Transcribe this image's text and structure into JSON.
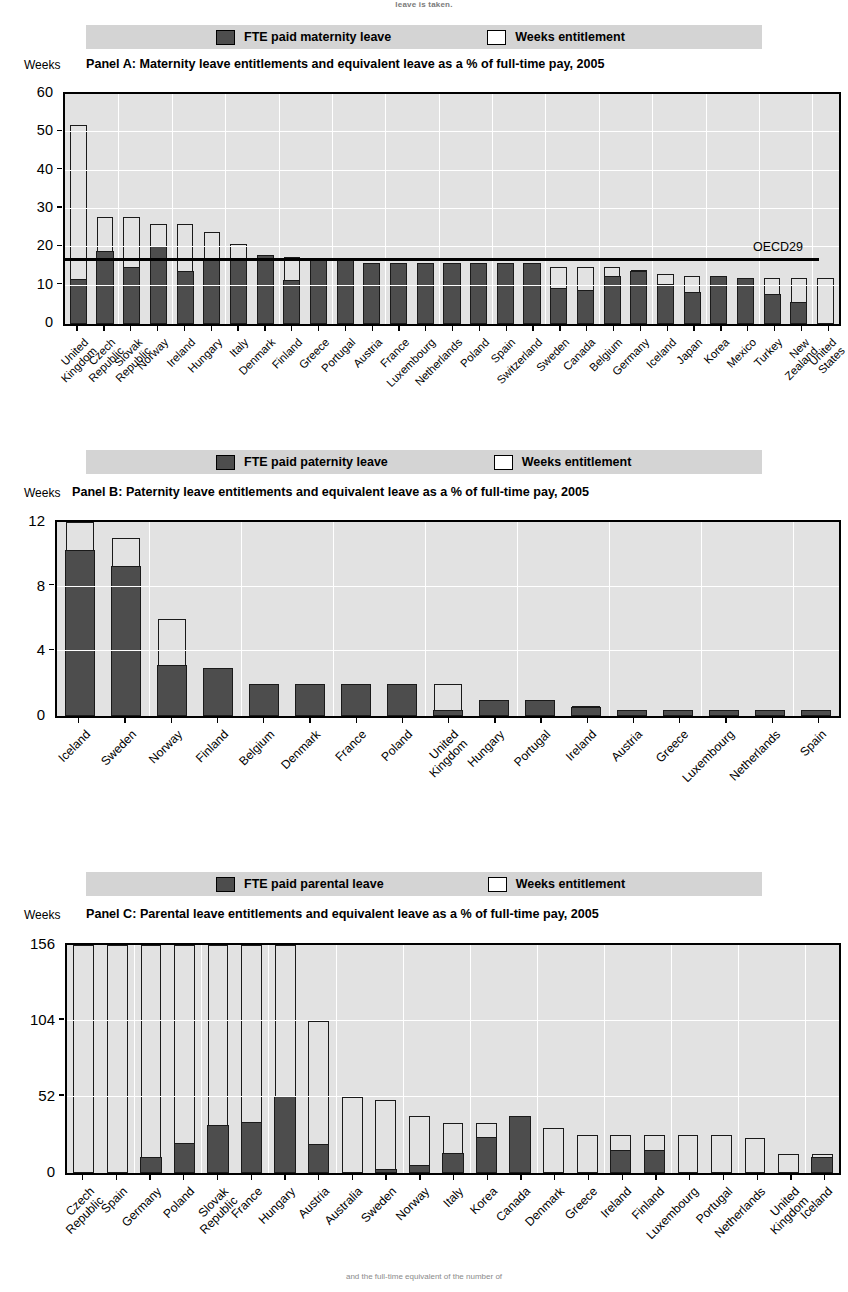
{
  "top_caption": "leave is taken.",
  "footer_caption": "and the full-time equivalent of the number of",
  "legend": {
    "entitlement_label": "Weeks entitlement",
    "panelA_fte_label": "FTE paid maternity leave",
    "panelB_fte_label": "FTE paid paternity leave",
    "panelC_fte_label": "FTE paid parental leave"
  },
  "axis_unit_label": "Weeks",
  "reference_line": {
    "label": "OECD29",
    "value": 17.4
  },
  "colors": {
    "fte": "#4d4d4d",
    "entitlement": "#ffffff",
    "plot_bg": "#e2e2e2",
    "legend_bg": "#d4d4d4",
    "grid": "#ffffff",
    "axis": "#000000"
  },
  "chart_data": [
    {
      "type": "bar",
      "panel": "Panel A",
      "title": "Panel A:  Maternity leave entitlements and equivalent leave as a % of full-time pay, 2005",
      "ylabel": "Weeks",
      "ylim": [
        0,
        60
      ],
      "yticks": [
        0,
        10,
        20,
        30,
        40,
        50,
        60
      ],
      "grid": true,
      "legend_position": "top",
      "reference_line": {
        "name": "OECD29",
        "value": 17.4
      },
      "categories": [
        "United Kingdom",
        "Czech Republic",
        "Slovak Republic",
        "Norway",
        "Ireland",
        "Hungary",
        "Italy",
        "Denmark",
        "Finland",
        "Greece",
        "Portugal",
        "Austria",
        "France",
        "Luxembourg",
        "Netherlands",
        "Poland",
        "Spain",
        "Switzerland",
        "Sweden",
        "Canada",
        "Belgium",
        "Germany",
        "Iceland",
        "Japan",
        "Korea",
        "Mexico",
        "Turkey",
        "New Zealand",
        "United States"
      ],
      "series": [
        {
          "name": "Weeks entitlement",
          "values": [
            52,
            28,
            28,
            26,
            26,
            24,
            21,
            18,
            17.5,
            17,
            17,
            16,
            16,
            16,
            16,
            16,
            16,
            16,
            15,
            15,
            15,
            14,
            13,
            12.5,
            12.5,
            12,
            12,
            12,
            12
          ]
        },
        {
          "name": "FTE paid maternity leave",
          "values": [
            11.7,
            19,
            15,
            20.5,
            14,
            17,
            17,
            18,
            11.5,
            17,
            17,
            16,
            16,
            16,
            16,
            16,
            16,
            16,
            9.6,
            9,
            12.6,
            14,
            10.5,
            8.4,
            12.5,
            12,
            8,
            5.8,
            0
          ]
        }
      ]
    },
    {
      "type": "bar",
      "panel": "Panel B",
      "title": "Panel B: Paternity leave entitlements and equivalent leave as a % of full-time pay, 2005",
      "ylabel": "Weeks",
      "ylim": [
        0,
        12
      ],
      "yticks": [
        0,
        4,
        8,
        12
      ],
      "grid": true,
      "legend_position": "top",
      "categories": [
        "Iceland",
        "Sweden",
        "Norway",
        "Finland",
        "Belgium",
        "Denmark",
        "France",
        "Poland",
        "United Kingdom",
        "Hungary",
        "Portugal",
        "Ireland",
        "Austria",
        "Greece",
        "Luxembourg",
        "Netherlands",
        "Spain"
      ],
      "series": [
        {
          "name": "Weeks entitlement",
          "values": [
            12,
            11,
            6,
            3,
            2,
            2,
            2,
            2,
            2,
            1,
            1,
            0.6,
            0.4,
            0.4,
            0.4,
            0.4,
            0.4
          ]
        },
        {
          "name": "FTE paid paternity leave",
          "values": [
            10.3,
            9.3,
            3.2,
            3,
            2,
            2,
            2,
            2,
            0.4,
            1,
            1,
            0.6,
            0.4,
            0.4,
            0.4,
            0.4,
            0.4
          ]
        }
      ]
    },
    {
      "type": "bar",
      "panel": "Panel C",
      "title": "Panel C:  Parental leave entitlements and equivalent leave as a % of full-time pay, 2005",
      "ylabel": "Weeks",
      "ylim": [
        0,
        156
      ],
      "yticks": [
        0,
        52,
        104,
        156
      ],
      "grid": true,
      "legend_position": "top",
      "categories": [
        "Czech Republic",
        "Spain",
        "Germany",
        "Poland",
        "Slovak Republic",
        "France",
        "Hungary",
        "Austria",
        "Australia",
        "Sweden",
        "Norway",
        "Italy",
        "Korea",
        "Canada",
        "Denmark",
        "Greece",
        "Ireland",
        "Finland",
        "Luxembourg",
        "Portugal",
        "Netherlands",
        "United Kingdom",
        "Iceland"
      ],
      "series": [
        {
          "name": "Weeks entitlement",
          "values": [
            156,
            156,
            156,
            156,
            156,
            156,
            156,
            104,
            52,
            50,
            39,
            34,
            34,
            34,
            31,
            26,
            26,
            26,
            26,
            26,
            24,
            13,
            13
          ]
        },
        {
          "name": "FTE paid parental leave",
          "values": [
            0,
            0,
            11,
            21,
            33,
            35,
            53,
            20,
            0,
            3,
            6,
            14,
            25,
            39,
            0,
            0,
            16,
            16,
            0,
            0,
            0,
            0,
            11
          ]
        }
      ]
    }
  ]
}
